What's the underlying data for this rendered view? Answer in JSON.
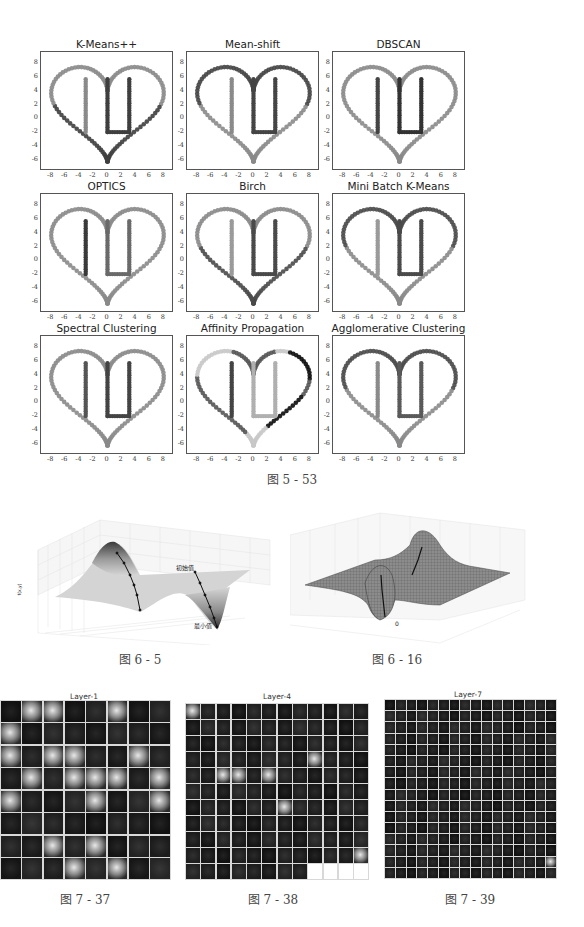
{
  "figure_5_53": {
    "caption": "图 5 - 53",
    "y_ticks": [
      "8",
      "6",
      "4",
      "2",
      "0",
      "-2",
      "-4",
      "-6"
    ],
    "x_ticks": [
      "-8",
      "-6",
      "-4",
      "-2",
      "0",
      "2",
      "4",
      "6",
      "8"
    ],
    "panels": [
      {
        "title": "K-Means++",
        "colors": {
          "heart_top": "#8a8a8a",
          "heart_bottom": "#3f3f3f",
          "I": "#8a8a8a",
          "U": "#3f3f3f"
        }
      },
      {
        "title": "Mean-shift",
        "colors": {
          "heart_top": "#454545",
          "heart_bottom": "#8a8a8a",
          "I": "#8a8a8a",
          "U": "#454545"
        }
      },
      {
        "title": "DBSCAN",
        "colors": {
          "heart_top": "#8a8a8a",
          "heart_bottom": "#8a8a8a",
          "I": "#454545",
          "U": "#333333"
        }
      },
      {
        "title": "OPTICS",
        "colors": {
          "heart_top": "#8a8a8a",
          "heart_bottom": "#8a8a8a",
          "I": "#3a3a3a",
          "U": "#6a6a6a"
        }
      },
      {
        "title": "Birch",
        "colors": {
          "heart_top": "#8a8a8a",
          "heart_bottom": "#4a4a4a",
          "I": "#9a9a9a",
          "U": "#4a4a4a"
        }
      },
      {
        "title": "Mini Batch K-Means",
        "colors": {
          "heart_top": "#4a4a4a",
          "heart_bottom": "#8a8a8a",
          "I": "#9a9a9a",
          "U": "#4a4a4a"
        }
      },
      {
        "title": "Spectral Clustering",
        "colors": {
          "heart_top": "#8a8a8a",
          "heart_bottom": "#8a8a8a",
          "I": "#555555",
          "U": "#444444"
        }
      },
      {
        "title": "Affinity Propagation",
        "colors": {
          "heart_top": "#555555",
          "heart_bottom": "#555555",
          "I": "#444444",
          "U": "#b0b0b0",
          "accent_dark": "#0c0c0c",
          "accent_light": "#c8c8c8"
        }
      },
      {
        "title": "Agglomerative Clustering",
        "colors": {
          "heart_top": "#4a4a4a",
          "heart_bottom": "#8a8a8a",
          "I": "#8a8a8a",
          "U": "#5a5a5a"
        }
      }
    ]
  },
  "figure_6_5": {
    "caption": "图 6 - 5",
    "z_label": "f(x,y)",
    "z_ticks": [
      "8",
      "6",
      "4",
      "2",
      "0",
      "-2",
      "-4",
      "-6"
    ],
    "x_ticks": [
      "3",
      "2",
      "1",
      "0",
      "-1"
    ],
    "y_ticks": [
      "-1.0",
      "-0.5",
      "0.0",
      "0.5",
      "1.0",
      "1.5",
      "2.0",
      "2.5",
      "3.0"
    ],
    "x_label": "x",
    "y_label": "y",
    "annotation_start": "初始值",
    "annotation_end": "最小值"
  },
  "figure_6_16": {
    "caption": "图 6 - 16",
    "z_ticks": [
      "8",
      "6",
      "4",
      "2",
      "0",
      "-2",
      "-4",
      "-6"
    ],
    "x_ticks": [
      "-3",
      "-2",
      "-1",
      "0",
      "1",
      "2",
      "3"
    ],
    "y_ticks": [
      "-3",
      "-2",
      "-1",
      "0",
      "1",
      "2",
      "3"
    ],
    "annotation_min": "0"
  },
  "figure_7_37": {
    "caption": "图 7 - 37",
    "layer_title": "Layer-1",
    "cols": 8,
    "rows": 8,
    "count": 64,
    "bright_cells": [
      1,
      2,
      5,
      8,
      16,
      18,
      19,
      22,
      25,
      27,
      28,
      29,
      31,
      32,
      36,
      39,
      50,
      52,
      59,
      61
    ]
  },
  "figure_7_38": {
    "caption": "图 7 - 38",
    "layer_title": "Layer-4",
    "cols": 12,
    "rows": 11,
    "count": 128,
    "bright_cells": [
      0,
      44,
      50,
      51,
      53,
      78,
      119
    ]
  },
  "figure_7_39": {
    "caption": "图 7 - 39",
    "layer_title": "Layer-7",
    "cols": 16,
    "rows": 16,
    "count": 256,
    "bright_cells": [
      239
    ]
  }
}
